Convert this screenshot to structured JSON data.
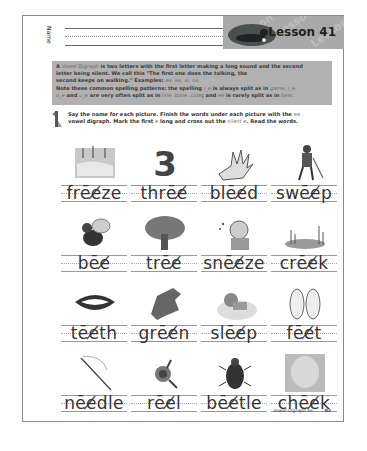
{
  "header": {
    "name_label": "Name",
    "lesson_title": "Lesson 41",
    "watermark_text": "Lesson"
  },
  "info_box": {
    "line1_pre": "A ",
    "line1_term": "Vowel Digraph",
    "line1_post": " is two letters with the first letter making a long sound and the second",
    "line2": "letter being silent. We call this \"The first one does the talking, the",
    "line3_pre": "second keeps on walking.\"  Examples: ",
    "line3_examples": "ee, ea, ai, oa.",
    "line4_pre": "Note these common spelling patterns:  the spelling ",
    "line4_ie": "i_e",
    "line4_mid": " is always split as in ",
    "line4_ex": "game, i_e,",
    "line5_pre": "",
    "line5_a": "o_e",
    "line5_mid": " and ",
    "line5_b": "u_e",
    "line5_mid2": " are very often split as in ",
    "line5_ex": "line, bone, cute",
    "line5_mid3": "; and ",
    "line5_c": "ee",
    "line5_post": " is rarely split as in ",
    "line5_ex2": "beet."
  },
  "instructions": {
    "icon": "pencil-number-1-icon",
    "line1_pre": "Say the name for each picture. Finish the words under each picture with the ",
    "line1_ital": "ee",
    "line2_pre": "vowel digraph. Mark the first ",
    "line2_e": "e",
    "line2_mid": " long and cross out the ",
    "line2_silent": "silent e",
    "line2_post": ".  Read the words."
  },
  "items": [
    {
      "word": "frēe̸ze",
      "picture": "frozen-pond"
    },
    {
      "word": "thrēe̸",
      "picture": "number-three"
    },
    {
      "word": "blēe̸d",
      "picture": "bleeding-hand"
    },
    {
      "word": "swēe̸p",
      "picture": "man-sweeping"
    },
    {
      "word": "bēe̸",
      "picture": "bee"
    },
    {
      "word": "trēe̸",
      "picture": "tree"
    },
    {
      "word": "snēe̸ze",
      "picture": "person-sneezing"
    },
    {
      "word": "crēe̸k",
      "picture": "creek"
    },
    {
      "word": "tēe̸th",
      "picture": "teeth-smile"
    },
    {
      "word": "grēe̸n",
      "picture": "green-splotch"
    },
    {
      "word": "slēe̸p",
      "picture": "child-sleeping"
    },
    {
      "word": "fēe̸t",
      "picture": "feet"
    },
    {
      "word": "nēe̸dle",
      "picture": "needle"
    },
    {
      "word": "rēe̸l",
      "picture": "fishing-reel"
    },
    {
      "word": "bēe̸tle",
      "picture": "beetle"
    },
    {
      "word": "chēe̸k",
      "picture": "baby-cheek"
    }
  ],
  "footer": {
    "label": "Vowel Digraph ee",
    "page_number": "83"
  }
}
